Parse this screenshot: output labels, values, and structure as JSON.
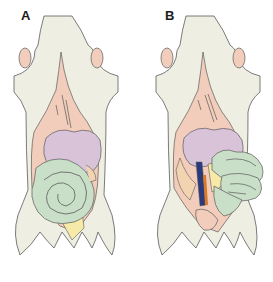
{
  "panels": [
    {
      "label": "A",
      "description": "Rodent ventral dissection with intestines coiled in spiral in situ"
    },
    {
      "label": "B",
      "description": "Rodent ventral dissection with intestines displaced to the right exposing vessels"
    }
  ],
  "colors": {
    "body": "#efeee2",
    "outline": "#5a5a5a",
    "skin_pink": "#f2cdbb",
    "liver_purple": "#d8c3d8",
    "intestine_green": "#c9dfc8",
    "fat_yellow": "#f7eaa8",
    "vessel_blue": "#2b3a7a",
    "vessel_orange": "#d87a2a",
    "peach": "#f3d4b0"
  }
}
